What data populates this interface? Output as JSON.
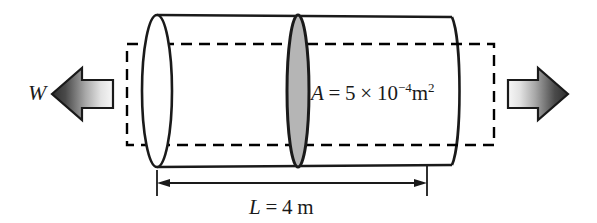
{
  "figure": {
    "background_color": "#ffffff",
    "width": 597,
    "height": 223
  },
  "labels": {
    "load_symbol": "W",
    "area": {
      "variable": "A",
      "equals": "=",
      "coefficient": "5",
      "times": "×",
      "base": "10",
      "exponent": "−4",
      "unit": "m",
      "unit_exponent": "2",
      "full_text": "A = 5 × 10−4 m2"
    },
    "length": {
      "variable": "L",
      "equals": "=",
      "value": "4",
      "unit": "m",
      "full_text": "L = 4 m"
    }
  },
  "colors": {
    "outline": "#1a1a1a",
    "cylinder_fill": "#ffffff",
    "cross_section_fill": "#b5b5b5",
    "dashed_rect": "#000000",
    "arrow_dark": "#3a3a3a",
    "arrow_light": "#f2f2f2",
    "dimension_line": "#1a1a1a"
  },
  "geometry": {
    "cylinder": {
      "left_cap_cx": 157,
      "left_cap_rx": 15,
      "left_cap_ry": 76,
      "right_end_x": 455,
      "top_y": 15,
      "bottom_y": 167
    },
    "cross_section": {
      "cx": 298,
      "rx": 11,
      "ry": 76
    },
    "dashed_rect": {
      "x": 127,
      "y": 44,
      "width": 367,
      "height": 101
    },
    "left_arrow": {
      "x": 52,
      "y": 68,
      "width": 61,
      "height": 52,
      "direction": "left"
    },
    "right_arrow": {
      "x": 508,
      "y": 68,
      "width": 60,
      "height": 52,
      "direction": "right"
    },
    "dimension": {
      "y": 183,
      "x_start": 157,
      "x_end": 427
    }
  }
}
